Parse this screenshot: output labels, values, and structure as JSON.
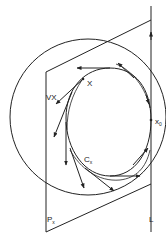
{
  "diagram": {
    "labels": {
      "grad": "VX",
      "point": "X",
      "x0_main": "x",
      "x0_sub": "0",
      "curve_main": "C",
      "curve_sub": "x",
      "plane_main": "P",
      "plane_sub": "x",
      "line": "L"
    },
    "colors": {
      "stroke": "#222222",
      "background": "#ffffff"
    }
  }
}
